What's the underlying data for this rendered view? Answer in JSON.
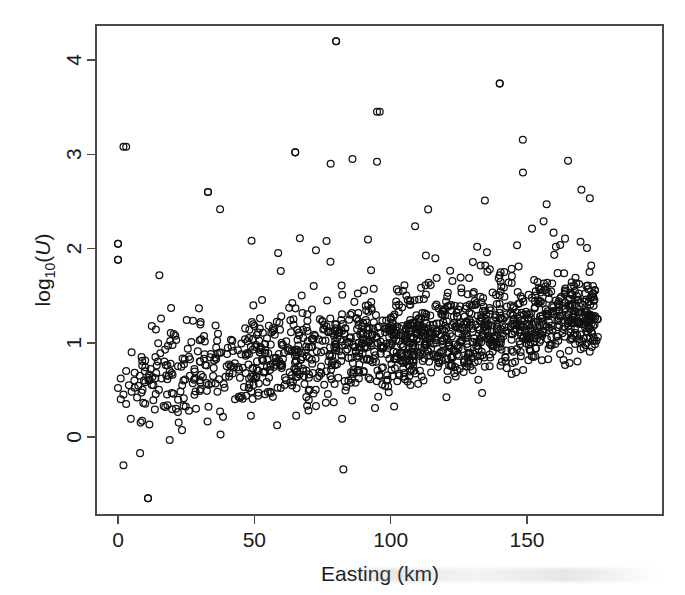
{
  "figure": {
    "background_color": "#ffffff",
    "point_color": "#111111",
    "axis_color": "#4a4a4a",
    "width": 685,
    "height": 595
  },
  "axes": {
    "x_title": "Easting (km)",
    "y_title_prefix": "log",
    "y_title_subscript": "10",
    "y_title_open_paren": "(",
    "y_title_variable": "U",
    "y_title_close_paren": ")",
    "x_tick_labels": [
      "0",
      "50",
      "100",
      "150"
    ],
    "y_tick_labels": [
      "0",
      "1",
      "2",
      "3",
      "4"
    ]
  },
  "chart_data": {
    "type": "scatter",
    "title": "",
    "xlabel": "Easting (km)",
    "ylabel": "log10(U)",
    "xlim": [
      -8,
      182
    ],
    "ylim": [
      -0.9,
      4.55
    ],
    "xticks": [
      0,
      50,
      100,
      150
    ],
    "yticks": [
      0,
      1,
      2,
      3,
      4
    ],
    "grid": false,
    "legend": null,
    "marker": "open-circle",
    "marker_radius_px": 3.4,
    "n_points": 1450,
    "trend": {
      "intercept": 0.56,
      "slope_per_km": 0.0043,
      "spread_sd_start": 0.3,
      "spread_sd_end": 0.22
    },
    "notable_outliers": [
      {
        "x": 80,
        "y": 4.2
      },
      {
        "x": 140,
        "y": 3.75
      },
      {
        "x": 96,
        "y": 3.45
      },
      {
        "x": 3,
        "y": 3.08
      },
      {
        "x": 65,
        "y": 3.02
      },
      {
        "x": 86,
        "y": 2.95
      },
      {
        "x": 95,
        "y": 2.92
      },
      {
        "x": 78,
        "y": 2.9
      },
      {
        "x": 33,
        "y": 2.6
      },
      {
        "x": 0,
        "y": 2.05
      },
      {
        "x": 0,
        "y": 1.88
      },
      {
        "x": 11,
        "y": -0.65
      },
      {
        "x": 2,
        "y": -0.3
      }
    ],
    "series": [
      {
        "name": "boreholes",
        "x": [
          0,
          0,
          0,
          1,
          1,
          2,
          2,
          3,
          3,
          4,
          5,
          5,
          6,
          7,
          8,
          9,
          10,
          11,
          12,
          13,
          14,
          15,
          16,
          17,
          18,
          19,
          20,
          22,
          24,
          26,
          28,
          30,
          33,
          36,
          40,
          44,
          48,
          52,
          56,
          60,
          65,
          70,
          75,
          80,
          85,
          90,
          95,
          100,
          105,
          110,
          115,
          120,
          125,
          130,
          135,
          140,
          145,
          150,
          155,
          160,
          165,
          170,
          173,
          175
        ],
        "y": [
          2.05,
          1.88,
          0.52,
          0.62,
          0.4,
          3.08,
          0.45,
          0.7,
          0.35,
          0.55,
          0.48,
          0.9,
          0.6,
          0.42,
          0.65,
          0.5,
          0.58,
          -0.65,
          0.72,
          0.55,
          0.68,
          0.5,
          0.62,
          0.8,
          0.45,
          0.7,
          0.66,
          0.75,
          0.6,
          0.85,
          0.72,
          0.8,
          2.6,
          0.95,
          0.88,
          0.92,
          1.05,
          0.9,
          0.98,
          1.0,
          3.02,
          0.95,
          1.02,
          4.2,
          1.05,
          1.1,
          3.45,
          1.12,
          1.08,
          1.15,
          1.1,
          1.18,
          1.2,
          1.15,
          1.22,
          3.75,
          1.25,
          1.2,
          1.28,
          1.3,
          1.25,
          1.32,
          1.3,
          1.28
        ]
      }
    ]
  }
}
